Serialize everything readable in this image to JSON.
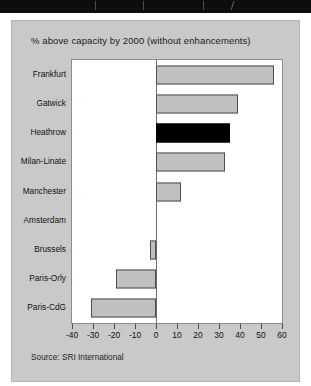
{
  "banner": {
    "name": "top-black-banner",
    "color": "#0d0d0d"
  },
  "card": {
    "background": "#c9c9c9",
    "title": "% above capacity by 2000 (without enhancements)",
    "source": "Source: SRI International"
  },
  "colors": {
    "bar_fill": "#c0c0c0",
    "bar_border": "#4d4d4d",
    "highlight_fill": "#000000",
    "plot_background": "#ffffff",
    "card_background": "#c9c9c9",
    "axis": "#4a4a4a",
    "text": "#121212"
  },
  "chart_data": {
    "type": "bar",
    "orientation": "horizontal",
    "title": "% above capacity by 2000 (without enhancements)",
    "xlabel": "",
    "ylabel": "",
    "xlim": [
      -40,
      60
    ],
    "xticks": [
      -40,
      -30,
      -20,
      -10,
      0,
      10,
      20,
      30,
      40,
      50,
      60
    ],
    "xtick_labels": [
      "-40",
      "-30",
      "-20",
      "-10",
      "0",
      "10",
      "20",
      "30",
      "40",
      "50",
      "60"
    ],
    "grid": false,
    "legend": null,
    "source": "Source: SRI International",
    "highlight_category": "Heathrow",
    "categories": [
      "Frankfurt",
      "Gatwick",
      "Heathrow",
      "Milan-Linate",
      "Manchester",
      "Amsterdam",
      "Brussels",
      "Paris-Orly",
      "Paris-CdG"
    ],
    "values": [
      56,
      39,
      35,
      33,
      12,
      0,
      -3,
      -19,
      -31
    ],
    "series": [
      {
        "name": "% above capacity by 2000",
        "values": [
          56,
          39,
          35,
          33,
          12,
          0,
          -3,
          -19,
          -31
        ]
      }
    ]
  }
}
